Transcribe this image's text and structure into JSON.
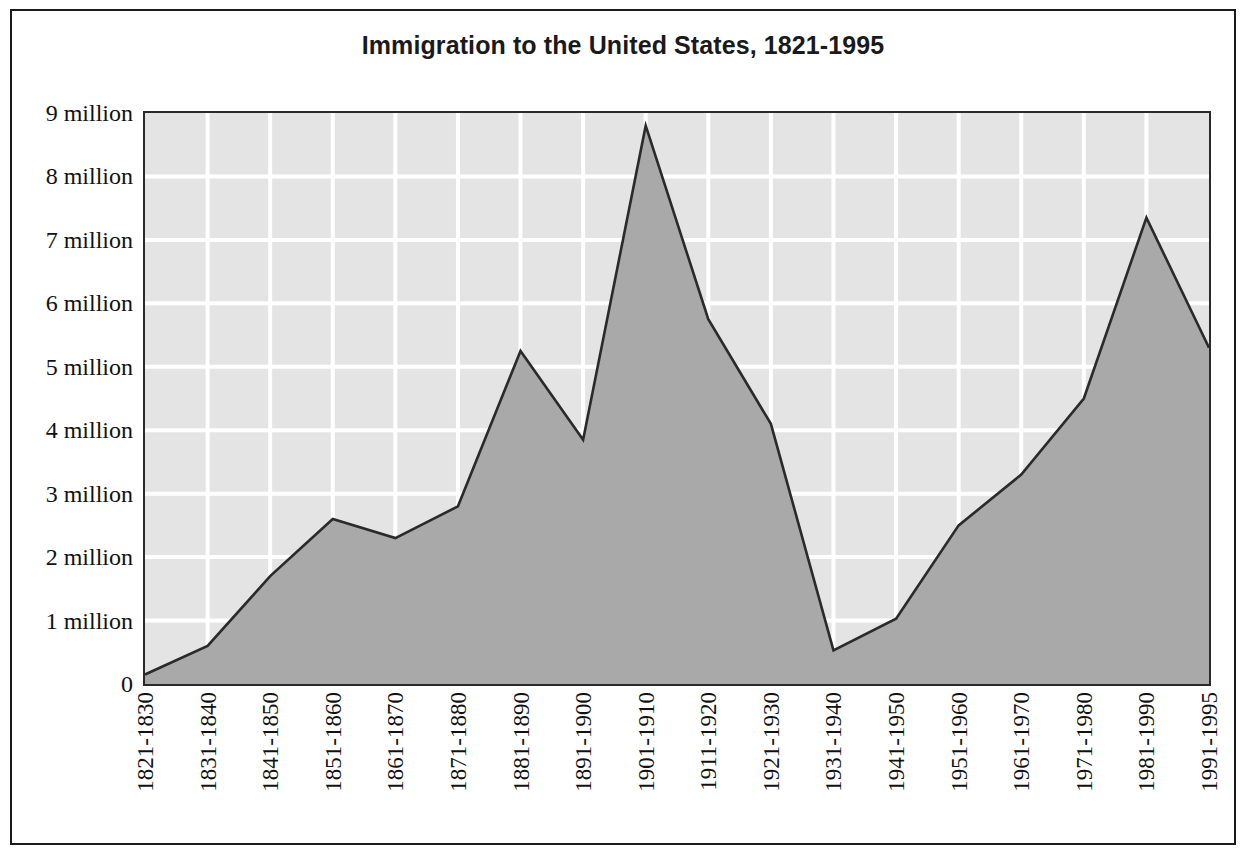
{
  "chart_data": {
    "type": "area",
    "title": "Immigration to the United States, 1821-1995",
    "xlabel": "",
    "ylabel": "",
    "ylim": [
      0,
      9
    ],
    "unit": "million",
    "grid": true,
    "legend": "none",
    "categories": [
      "1821-1830",
      "1831-1840",
      "1841-1850",
      "1851-1860",
      "1861-1870",
      "1871-1880",
      "1881-1890",
      "1891-1900",
      "1901-1910",
      "1911-1920",
      "1921-1930",
      "1931-1940",
      "1941-1950",
      "1951-1960",
      "1961-1970",
      "1971-1980",
      "1981-1990",
      "1991-1995"
    ],
    "values": [
      0.15,
      0.6,
      1.7,
      2.6,
      2.3,
      2.8,
      5.25,
      3.85,
      8.8,
      5.75,
      4.1,
      0.53,
      1.03,
      2.5,
      3.3,
      4.5,
      7.35,
      5.3
    ],
    "ytick_values": [
      0,
      1,
      2,
      3,
      4,
      5,
      6,
      7,
      8,
      9
    ],
    "ytick_labels": [
      "0",
      "1 million",
      "2 million",
      "3 million",
      "4 million",
      "5 million",
      "6 million",
      "7 million",
      "8 million",
      "9 million"
    ],
    "colors": {
      "area_fill": "#a9a9a9",
      "area_line": "#2a2a2a",
      "plot_background": "#e4e4e4",
      "gridline": "#ffffff",
      "frame": "#1a1a1a",
      "text": "#111111"
    }
  }
}
